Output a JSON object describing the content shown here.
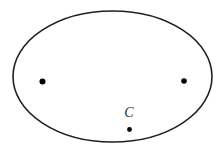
{
  "figure": {
    "type": "geometry-diagram",
    "canvas": {
      "width": 224,
      "height": 159,
      "background": "#ffffff"
    },
    "shapes": [
      {
        "name": "ellipse-outline",
        "kind": "ellipse",
        "cx": 112.5,
        "cy": 76.5,
        "rx": 99.5,
        "ry": 65.5,
        "stroke": "#231f20",
        "stroke_width": 1.6,
        "fill": "none"
      }
    ],
    "points": [
      {
        "name": "left-point",
        "label": "",
        "cx": 42.5,
        "cy": 81.5,
        "r": 3.0,
        "color": "#000000"
      },
      {
        "name": "right-point",
        "label": "",
        "cx": 184.0,
        "cy": 81.0,
        "r": 2.8,
        "color": "#000000"
      },
      {
        "name": "center-point-c",
        "label": "C",
        "cx": 129.5,
        "cy": 129.5,
        "r": 2.4,
        "color": "#000000",
        "label_x": 129.0,
        "label_y": 113.0
      }
    ],
    "labels": [
      {
        "name": "label-c",
        "text": "C",
        "x": 129.0,
        "y": 113.0,
        "color": "#2b2b2b"
      }
    ]
  }
}
